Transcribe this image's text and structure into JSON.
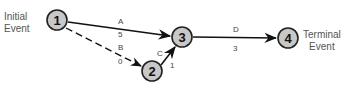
{
  "diagram": {
    "type": "activity-on-arrow network",
    "start_label": [
      "Initial",
      "Event"
    ],
    "end_label": [
      "Terminal",
      "Event"
    ],
    "nodes": [
      {
        "id": "1",
        "label": "1"
      },
      {
        "id": "2",
        "label": "2"
      },
      {
        "id": "3",
        "label": "3"
      },
      {
        "id": "4",
        "label": "4"
      }
    ],
    "edges": [
      {
        "from": "1",
        "to": "3",
        "activity": "A",
        "duration": "5",
        "style": "solid"
      },
      {
        "from": "1",
        "to": "2",
        "activity": "B",
        "duration": "0",
        "style": "dashed"
      },
      {
        "from": "2",
        "to": "3",
        "activity": "C",
        "duration": "1",
        "style": "solid"
      },
      {
        "from": "3",
        "to": "4",
        "activity": "D",
        "duration": "3",
        "style": "solid"
      }
    ]
  }
}
